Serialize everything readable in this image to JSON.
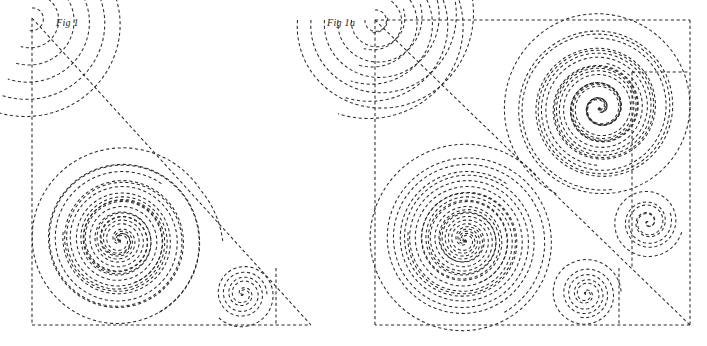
{
  "page": {
    "background_color": "#ffffff",
    "width": 707,
    "height": 346
  },
  "style": {
    "line_color": "#2a2a2a",
    "line_width": 1.05,
    "dash_pattern": "3.2 2.6",
    "caption_color": "#222222"
  },
  "figures": [
    {
      "id": "fig-1",
      "caption": "Fig 1",
      "shape": "right-triangle",
      "boundary": {
        "points": "32,18 32,325 311,325",
        "note": "right angle at bottom-left; hypotenuse from top vertex to bottom-right vertex"
      },
      "spirals": [
        {
          "name": "large-spiral",
          "center_x": 120,
          "center_y": 240,
          "turns": 5.5,
          "max_radius": 95,
          "direction": "counterclockwise"
        },
        {
          "name": "small-spiral",
          "center_x": 243,
          "center_y": 294,
          "turns": 3.2,
          "max_radius": 34,
          "direction": "counterclockwise"
        }
      ],
      "arc_family": {
        "name": "corner-arc-family",
        "corner_x": 32,
        "corner_y": 18,
        "count": 6,
        "note": "nested arcs unwinding from the apex toward the hypotenuse"
      }
    },
    {
      "id": "fig-1a",
      "caption": "Fig 1a",
      "shape": "square",
      "boundary": {
        "x": 375,
        "y": 20,
        "width": 315,
        "height": 305,
        "note": "square formed by reflecting Fig 1 across its hypotenuse (anti-diagonal)"
      },
      "diagonal": {
        "from_x": 375,
        "from_y": 20,
        "to_x": 690,
        "to_y": 325,
        "note": "hypotenuse of the original triangle, now the square's anti-diagonal"
      },
      "spirals": [
        {
          "name": "large-spiral-lower-left",
          "center_x": 465,
          "center_y": 240,
          "turns": 5.5,
          "max_radius": 95,
          "direction": "counterclockwise"
        },
        {
          "name": "large-spiral-upper-right",
          "center_x": 600,
          "center_y": 108,
          "turns": 5.5,
          "max_radius": 95,
          "direction": "clockwise"
        },
        {
          "name": "small-spiral-bottom",
          "center_x": 586,
          "center_y": 294,
          "turns": 3.2,
          "max_radius": 34,
          "direction": "counterclockwise"
        },
        {
          "name": "small-spiral-right",
          "center_x": 648,
          "center_y": 222,
          "turns": 3.2,
          "max_radius": 34,
          "direction": "clockwise"
        }
      ],
      "arc_family": {
        "name": "corner-arc-family-mirrored",
        "corner_x": 375,
        "corner_y": 20,
        "count": 6,
        "note": "two interleaved arc families mirrored across the anti-diagonal at top-left corner"
      }
    }
  ]
}
